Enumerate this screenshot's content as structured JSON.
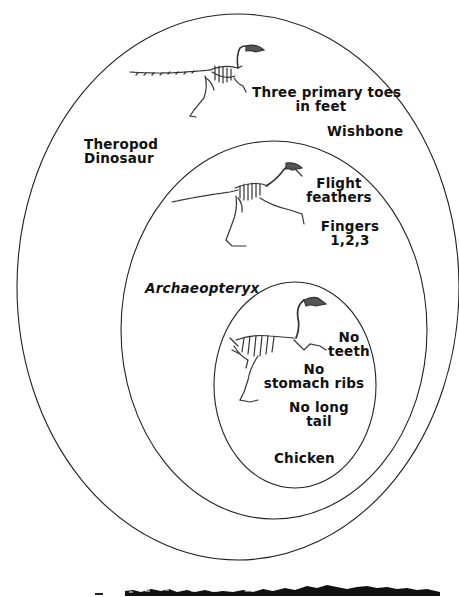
{
  "diagram": {
    "type": "nested-ellipse cladogram",
    "groups": [
      {
        "name": "Theropod Dinosaur",
        "line1": "Theropod",
        "line2": "Dinosaur",
        "traits": [
          {
            "line1": "Three primary toes",
            "line2": "in feet"
          },
          {
            "line1": "Wishbone"
          }
        ],
        "illustration": "theropod-skeleton"
      },
      {
        "name": "Archaeopteryx",
        "line1": "Archaeopteryx",
        "traits": [
          {
            "line1": "Flight",
            "line2": "feathers"
          },
          {
            "line1": "Fingers",
            "line2": "1,2,3"
          }
        ],
        "illustration": "archaeopteryx-skeleton"
      },
      {
        "name": "Chicken",
        "line1": "Chicken",
        "traits": [
          {
            "line1": "No",
            "line2": "teeth"
          },
          {
            "line1": "No",
            "line2": "stomach ribs"
          },
          {
            "line1": "No long",
            "line2": "tail"
          }
        ],
        "illustration": "chicken-skeleton"
      }
    ],
    "colors": {
      "background": "#ffffff",
      "ink": "#111111",
      "ellipse_stroke": "#222222"
    }
  }
}
